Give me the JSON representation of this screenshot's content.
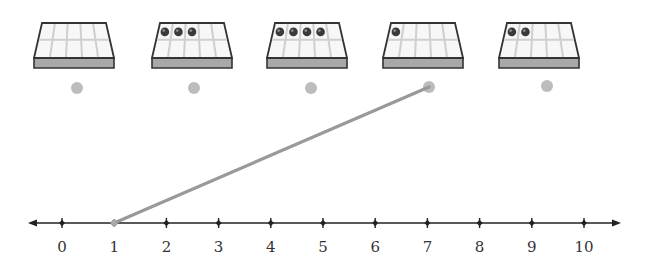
{
  "activity": {
    "type": "match-tenframe-to-number-line",
    "colors": {
      "tray_outline": "#333333",
      "tray_fill": "#f7f7f7",
      "tray_side": "#a8a8a8",
      "cell_line": "#cfcfcf",
      "counter": "#3a3a3a",
      "dot": "#bcbcbc",
      "connector": "#999999",
      "axis": "#222222"
    }
  },
  "trays": [
    {
      "id": "tray-1",
      "counters": 0,
      "x": 33
    },
    {
      "id": "tray-2",
      "counters": 3,
      "x": 151
    },
    {
      "id": "tray-3",
      "counters": 4,
      "x": 266
    },
    {
      "id": "tray-4",
      "counters": 1,
      "x": 382
    },
    {
      "id": "tray-5",
      "counters": 2,
      "x": 498
    }
  ],
  "tray_dots": [
    {
      "id": "dot-1",
      "cx": 77,
      "cy": 88
    },
    {
      "id": "dot-2",
      "cx": 194,
      "cy": 88
    },
    {
      "id": "dot-3",
      "cx": 311,
      "cy": 88
    },
    {
      "id": "dot-4",
      "cx": 429,
      "cy": 87
    },
    {
      "id": "dot-5",
      "cx": 547,
      "cy": 86
    }
  ],
  "connections": [
    {
      "from": "dot-4",
      "to_tick": 1
    }
  ],
  "number_line": {
    "ticks": [
      "0",
      "1",
      "2",
      "3",
      "4",
      "5",
      "6",
      "7",
      "8",
      "9",
      "10"
    ],
    "start_x": 62,
    "spacing": 52.2,
    "y": 223,
    "label_y": 252
  }
}
